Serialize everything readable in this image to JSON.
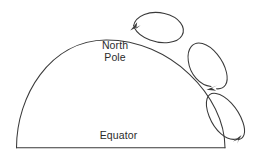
{
  "diagram": {
    "labels": {
      "north_pole_line1": "North",
      "north_pole_line2": "Pole",
      "equator": "Equator"
    },
    "colors": {
      "stroke": "#3a3a3a",
      "text": "#2b2b2b",
      "background": "#ffffff"
    },
    "shapes": {
      "hemisphere": {
        "name": "hemisphere-dome",
        "baseline_y": 148,
        "left_x": 16,
        "right_x": 225,
        "apex_x": 105,
        "apex_y": 40
      },
      "cells": [
        {
          "name": "polar-cell-loop",
          "position": "top",
          "arrow_direction": "counterclockwise",
          "arrowhead_at": "left"
        },
        {
          "name": "ferrel-cell-loop",
          "position": "middle",
          "arrow_direction": "clockwise",
          "arrowhead_at": "bottom"
        },
        {
          "name": "hadley-cell-loop",
          "position": "bottom",
          "arrow_direction": "clockwise",
          "arrowhead_at": "bottom-right"
        }
      ]
    }
  }
}
